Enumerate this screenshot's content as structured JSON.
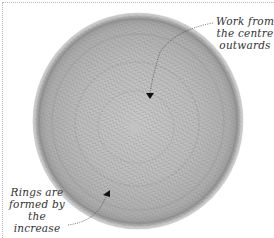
{
  "image": {
    "subject": "knitted circular swatch",
    "background_color": "#ffffff",
    "knit_color": "#b4b4b4",
    "border_style": "dotted"
  },
  "annotations": [
    {
      "id": "centre",
      "lines": [
        "Work from",
        "the centre",
        "outwards"
      ],
      "text": "Work from the centre outwards"
    },
    {
      "id": "rings",
      "lines": [
        "Rings are",
        "formed by the",
        "increase rows"
      ],
      "text": "Rings are formed by the increase rows"
    }
  ]
}
